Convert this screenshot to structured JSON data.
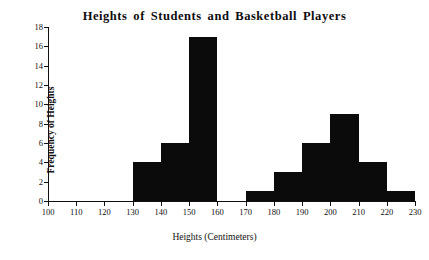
{
  "chart_data": {
    "type": "bar",
    "title": "Heights of Students and Basketball Players",
    "xlabel": "Heights (Centimeters)",
    "ylabel": "Frequency of Heights",
    "xlim": [
      100,
      230
    ],
    "ylim": [
      0,
      18
    ],
    "grid": false,
    "legend": null,
    "bin_width": 10,
    "bar_color": "#0b0b0b",
    "axis_color": "#101010",
    "background_color": "#ffffff",
    "xticks": [
      100,
      110,
      120,
      130,
      140,
      150,
      160,
      170,
      180,
      190,
      200,
      210,
      220,
      230
    ],
    "yticks": [
      0,
      2,
      4,
      6,
      8,
      10,
      12,
      14,
      16,
      18
    ],
    "bins": [
      {
        "start": 100,
        "end": 110,
        "value": 0
      },
      {
        "start": 110,
        "end": 120,
        "value": 0
      },
      {
        "start": 120,
        "end": 130,
        "value": 0
      },
      {
        "start": 130,
        "end": 140,
        "value": 4
      },
      {
        "start": 140,
        "end": 150,
        "value": 6
      },
      {
        "start": 150,
        "end": 160,
        "value": 17
      },
      {
        "start": 160,
        "end": 170,
        "value": 0
      },
      {
        "start": 170,
        "end": 180,
        "value": 1
      },
      {
        "start": 180,
        "end": 190,
        "value": 3
      },
      {
        "start": 190,
        "end": 200,
        "value": 6
      },
      {
        "start": 200,
        "end": 210,
        "value": 9
      },
      {
        "start": 210,
        "end": 220,
        "value": 4
      },
      {
        "start": 220,
        "end": 230,
        "value": 1
      }
    ],
    "categories": [
      "100-110",
      "110-120",
      "120-130",
      "130-140",
      "140-150",
      "150-160",
      "160-170",
      "170-180",
      "180-190",
      "190-200",
      "200-210",
      "210-220",
      "220-230"
    ],
    "values": [
      0,
      0,
      0,
      4,
      6,
      17,
      0,
      1,
      3,
      6,
      9,
      4,
      1
    ]
  }
}
